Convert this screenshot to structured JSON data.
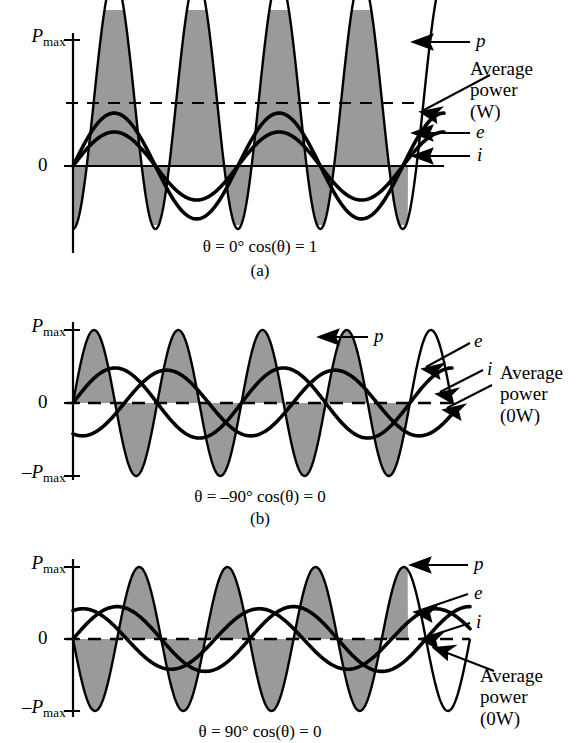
{
  "figure": {
    "width": 580,
    "height": 743,
    "fill_color": "#9a9a9a",
    "stroke_color": "#000000",
    "background": "#ffffff"
  },
  "axis": {
    "pmax_label": "P",
    "pmax_sub": "max",
    "neg_pmax_label": "–P",
    "neg_pmax_sub": "max",
    "zero_label": "0"
  },
  "panels": [
    {
      "id": "a",
      "letter": "(a)",
      "caption": "θ = 0°  cos(θ) = 1",
      "theta": "0°",
      "cos_theta": "1",
      "avg_power_text": "Average\npower\n(W)",
      "avg_power_line1": "Average",
      "avg_power_line2": "power",
      "avg_power_line3": "(W)",
      "curve_labels": {
        "p": "p",
        "e": "e",
        "i": "i"
      },
      "has_neg_axis_label": false
    },
    {
      "id": "b",
      "letter": "(b)",
      "caption": "θ = –90°  cos(θ) = 0",
      "theta": "–90°",
      "cos_theta": "0",
      "avg_power_line1": "Average",
      "avg_power_line2": "power",
      "avg_power_line3": "(0W)",
      "curve_labels": {
        "p": "p",
        "e": "e",
        "i": "i"
      },
      "has_neg_axis_label": true
    },
    {
      "id": "c",
      "letter": "(c)",
      "caption": "θ = 90°  cos(θ) = 0",
      "theta": "90°",
      "cos_theta": "0",
      "avg_power_line1": "Average",
      "avg_power_line2": "power",
      "avg_power_line3": "(0W)",
      "curve_labels": {
        "p": "p",
        "e": "e",
        "i": "i"
      },
      "has_neg_axis_label": true
    }
  ],
  "chart_data": {
    "type": "line",
    "xlabel": "",
    "ylabel": "",
    "x_range_cycles": [
      0,
      2.25
    ],
    "ylim": [
      -1.18,
      1.18
    ],
    "ytick_labels": [
      "P_max",
      "0",
      "-P_max"
    ],
    "ytick_values": [
      1,
      0,
      -1
    ],
    "grid": false,
    "legend_position": "right-of-plot-as-leader-labels",
    "shared_notes": [
      "p = e x i plotted at twice the fundamental frequency",
      "Shaded area under p represents energy delivered",
      "Dashed horizontal line marks the average power level"
    ],
    "panels": [
      {
        "id": "a",
        "theta_deg": 0,
        "cos_theta": 1,
        "average_power_level": 0.5,
        "average_power_units": "W",
        "series": [
          {
            "name": "p",
            "amplitude": 1.0,
            "offset": 0.5,
            "phase_deg": -90,
            "cycles": 2,
            "description": "p = Pmax/2 (1 - cos 2wt), entirely positive"
          },
          {
            "name": "e",
            "amplitude": 0.42,
            "offset": 0,
            "phase_deg": 0,
            "cycles": 1,
            "description": "voltage sine, in phase with i"
          },
          {
            "name": "i",
            "amplitude": 0.27,
            "offset": 0,
            "phase_deg": 0,
            "cycles": 1,
            "description": "current sine, in phase with e"
          }
        ]
      },
      {
        "id": "b",
        "theta_deg": -90,
        "cos_theta": 0,
        "average_power_level": 0,
        "average_power_units": "0W",
        "series": [
          {
            "name": "p",
            "amplitude": 1.0,
            "offset": 0,
            "phase_deg": 0,
            "cycles": 2,
            "description": "p symmetric about zero, zero average"
          },
          {
            "name": "e",
            "amplitude": 0.48,
            "offset": 0,
            "phase_deg": 0,
            "cycles": 1,
            "description": "voltage sine"
          },
          {
            "name": "i",
            "amplitude": 0.45,
            "offset": 0,
            "phase_deg": -110,
            "cycles": 1,
            "description": "current leads/lags voltage by 90 degrees"
          }
        ]
      },
      {
        "id": "c",
        "theta_deg": 90,
        "cos_theta": 0,
        "average_power_level": 0,
        "average_power_units": "0W",
        "series": [
          {
            "name": "p",
            "amplitude": 1.0,
            "offset": 0,
            "phase_deg": 180,
            "cycles": 2,
            "description": "p symmetric about zero, zero average"
          },
          {
            "name": "e",
            "amplitude": 0.45,
            "offset": 0,
            "phase_deg": 0,
            "cycles": 1,
            "description": "voltage sine"
          },
          {
            "name": "i",
            "amplitude": 0.42,
            "offset": 0,
            "phase_deg": 70,
            "cycles": 1,
            "description": "current shifted by +90 degrees"
          }
        ]
      }
    ]
  }
}
